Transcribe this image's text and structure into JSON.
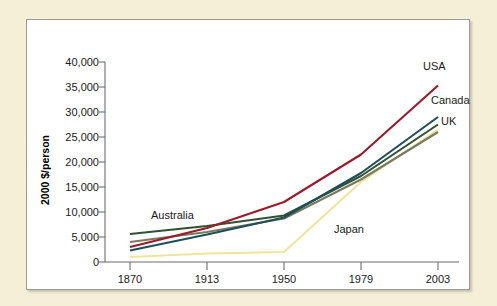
{
  "figure": {
    "background_color": "#f5efd8",
    "panel_color": "#ffffff",
    "panel_border_color": "#9a9a9a"
  },
  "chart_data": {
    "type": "line",
    "title": "",
    "subtitle": "",
    "xlabel": "Year",
    "ylabel": "2000 $/person",
    "categories": [
      "1870",
      "1913",
      "1950",
      "1979",
      "2003"
    ],
    "x_tick_labels": [
      "1870",
      "1913",
      "1950",
      "1979",
      "2003"
    ],
    "y_tick_labels": [
      "0",
      "5,000",
      "10,000",
      "15,000",
      "20,000",
      "25,000",
      "30,000",
      "35,000",
      "40,000"
    ],
    "y_tick_values": [
      0,
      5000,
      10000,
      15000,
      20000,
      25000,
      30000,
      35000,
      40000
    ],
    "ylim": [
      0,
      40000
    ],
    "grid": false,
    "legend_position": "inline-labels",
    "series": [
      {
        "name": "USA",
        "color": "#9b1b28",
        "values": [
          3000,
          6800,
          12000,
          21500,
          35300
        ],
        "label": "USA"
      },
      {
        "name": "Canada",
        "color": "#1f4e5a",
        "values": [
          2300,
          5500,
          8900,
          17800,
          29000
        ],
        "label": "Canada"
      },
      {
        "name": "Australia",
        "color": "#2f5233",
        "values": [
          5600,
          7200,
          9300,
          17200,
          27500
        ],
        "label": "Australia"
      },
      {
        "name": "UK",
        "color": "#7a7a5e",
        "values": [
          4000,
          6000,
          8700,
          16500,
          26000
        ],
        "label": "UK"
      },
      {
        "name": "Japan",
        "color": "#f0e59a",
        "values": [
          1000,
          1700,
          2000,
          16000,
          26500
        ],
        "label": "Japan"
      }
    ],
    "annotations": [
      {
        "text": "USA",
        "series": "USA",
        "x": 396,
        "y": 50
      },
      {
        "text": "Canada",
        "series": "Canada",
        "x": 404,
        "y": 84
      },
      {
        "text": "UK",
        "series": "UK",
        "x": 414,
        "y": 105
      },
      {
        "text": "Australia",
        "series": "Australia",
        "x": 124,
        "y": 199
      },
      {
        "text": "Japan",
        "series": "Japan",
        "x": 307,
        "y": 213
      }
    ]
  }
}
